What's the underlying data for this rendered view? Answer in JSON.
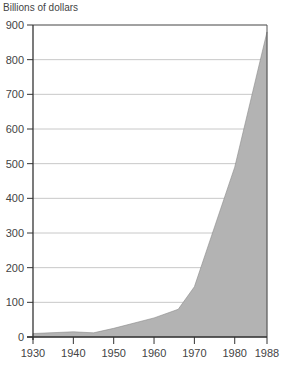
{
  "chart_data": {
    "type": "area",
    "title": "",
    "xlabel": "",
    "ylabel": "Billions of dollars",
    "x": [
      1930,
      1940,
      1945,
      1950,
      1960,
      1966,
      1970,
      1980,
      1988
    ],
    "series": [
      {
        "name": "Value",
        "values": [
          10,
          15,
          12,
          25,
          55,
          80,
          145,
          490,
          880
        ]
      }
    ],
    "x_ticks": [
      "1930",
      "1940",
      "1950",
      "1960",
      "1970",
      "1980",
      "1988"
    ],
    "y_ticks": [
      "0",
      "100",
      "200",
      "300",
      "400",
      "500",
      "600",
      "700",
      "800",
      "900"
    ],
    "xlim": [
      1930,
      1988
    ],
    "ylim": [
      0,
      900
    ],
    "grid": true,
    "legend": "none",
    "fill_color": "#b3b3b3"
  }
}
